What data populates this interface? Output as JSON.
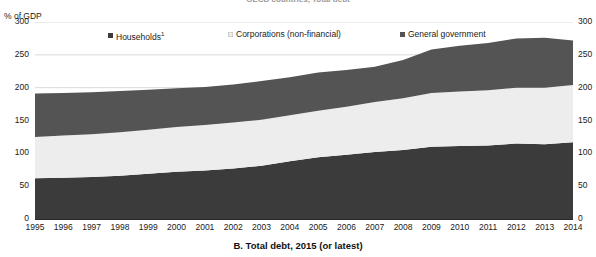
{
  "figure": {
    "clipped_title": "OECD countries, Total debt",
    "caption": "B. Total debt, 2015 (or latest)",
    "unit_label": "% of GDP",
    "footnote_marker": "1"
  },
  "legend": {
    "items": [
      {
        "label": "Households",
        "superscript": "1",
        "color": "#3b3b3b",
        "x": 108
      },
      {
        "label": "Corporations (non-financial)",
        "superscript": "",
        "color": "#ededed",
        "x": 228
      },
      {
        "label": "General government",
        "superscript": "",
        "color": "#545454",
        "x": 400
      }
    ]
  },
  "colors": {
    "households": "#3b3b3b",
    "corporations": "#ededed",
    "government": "#545454",
    "gridline": "#c9c9c9",
    "axis": "#2a2a2a",
    "background": "#ffffff"
  },
  "chart_data": {
    "type": "area",
    "stacked": true,
    "title": "B. Total debt, 2015 (or latest)",
    "xlabel": "",
    "ylabel": "% of GDP",
    "ylim": [
      0,
      300
    ],
    "yticks": [
      0,
      50,
      100,
      150,
      200,
      250,
      300
    ],
    "ytick_labels_left": [
      "0",
      "50",
      "100",
      "150",
      "200",
      "250",
      "300"
    ],
    "ytick_labels_right": [
      "0",
      "50",
      "100",
      "150",
      "200",
      "250",
      "300"
    ],
    "grid": true,
    "grid_axis": "y",
    "legend_position": "top",
    "x": [
      1995,
      1996,
      1997,
      1998,
      1999,
      2000,
      2001,
      2002,
      2003,
      2004,
      2005,
      2006,
      2007,
      2008,
      2009,
      2010,
      2011,
      2012,
      2013,
      2014
    ],
    "categories": [
      "1995",
      "1996",
      "1997",
      "1998",
      "1999",
      "2000",
      "2001",
      "2002",
      "2003",
      "2004",
      "2005",
      "2006",
      "2007",
      "2008",
      "2009",
      "2010",
      "2011",
      "2012",
      "2013",
      "2014"
    ],
    "series": [
      {
        "name": "Households",
        "color": "#3b3b3b",
        "values": [
          62,
          63,
          64,
          66,
          69,
          72,
          74,
          77,
          81,
          88,
          94,
          98,
          102,
          105,
          110,
          111,
          112,
          115,
          114,
          117
        ]
      },
      {
        "name": "Corporations (non-financial)",
        "color": "#ededed",
        "values": [
          63,
          64,
          65,
          66,
          67,
          68,
          69,
          70,
          70,
          70,
          71,
          73,
          76,
          79,
          82,
          83,
          84,
          85,
          86,
          87
        ]
      },
      {
        "name": "General government",
        "color": "#545454",
        "values": [
          66,
          65,
          64,
          63,
          61,
          59,
          58,
          58,
          59,
          58,
          58,
          56,
          54,
          58,
          66,
          70,
          72,
          75,
          76,
          68
        ]
      }
    ],
    "cumulative_totals": [
      191,
      192,
      193,
      195,
      197,
      199,
      201,
      205,
      210,
      216,
      223,
      227,
      232,
      242,
      258,
      264,
      268,
      275,
      276,
      272
    ]
  }
}
